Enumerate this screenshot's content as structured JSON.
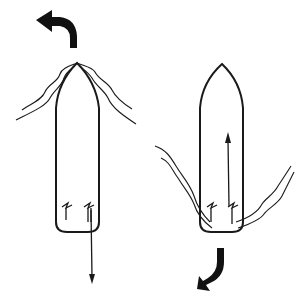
{
  "diagram": {
    "title": "Twin-propeller boat: forward vs. reverse thrust turning",
    "colors": {
      "ink": "#1a1a1a",
      "background": "#ffffff"
    },
    "panels": [
      {
        "id": "left",
        "description": "Boat moving forward (thrust arrow pointing aft from starboard propeller), bow swinging to port",
        "turn_arrow": "curved-arrow-up-left",
        "thrust_arrow": "arrow-down",
        "propellers": 2
      },
      {
        "id": "right",
        "description": "Boat in reverse (thrust arrow pointing forward from starboard propeller), stern swinging to port",
        "turn_arrow": "curved-arrow-down-left",
        "thrust_arrow": "arrow-up",
        "propellers": 2
      }
    ]
  }
}
